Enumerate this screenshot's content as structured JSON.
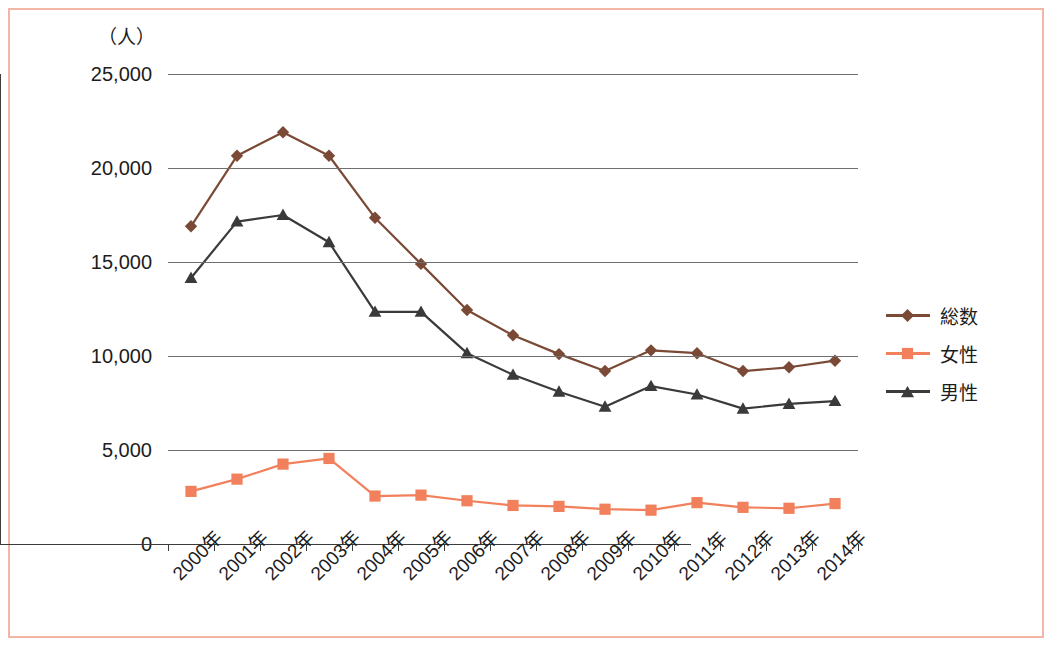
{
  "figure": {
    "unit_label": "（人）",
    "border_color": "#f3b6a6",
    "caption": ""
  },
  "legend": {
    "position": "right",
    "items": [
      {
        "label": "総数",
        "color": "#7a4a36",
        "marker": "diamond",
        "marker_icon": "diamond-marker-icon"
      },
      {
        "label": "女性",
        "color": "#f2805c",
        "marker": "square",
        "marker_icon": "square-marker-icon"
      },
      {
        "label": "男性",
        "color": "#3a3a3a",
        "marker": "triangle",
        "marker_icon": "triangle-marker-icon"
      }
    ]
  },
  "axes": {
    "y_ticks": [
      "25,000",
      "20,000",
      "15,000",
      "10,000",
      "5,000",
      "0"
    ],
    "y_tick_values": [
      25000,
      20000,
      15000,
      10000,
      5000,
      0
    ],
    "x_ticks": [
      "2000年",
      "2001年",
      "2002年",
      "2003年",
      "2004年",
      "2005年",
      "2006年",
      "2007年",
      "2008年",
      "2009年",
      "2010年",
      "2011年",
      "2012年",
      "2013年",
      "2014年"
    ]
  },
  "chart_data": {
    "type": "line",
    "title": "",
    "subtitle": "",
    "xlabel": "",
    "ylabel": "（人）",
    "ylim": [
      0,
      25000
    ],
    "ytick_step": 5000,
    "grid": true,
    "legend_position": "right",
    "categories": [
      "2000年",
      "2001年",
      "2002年",
      "2003年",
      "2004年",
      "2005年",
      "2006年",
      "2007年",
      "2008年",
      "2009年",
      "2010年",
      "2011年",
      "2012年",
      "2013年",
      "2014年"
    ],
    "series": [
      {
        "name": "総数",
        "color": "#7a4a36",
        "marker": "diamond",
        "values": [
          16900,
          20650,
          21900,
          20650,
          17350,
          14900,
          12450,
          11100,
          10100,
          9200,
          10300,
          10150,
          9200,
          9400,
          9750
        ]
      },
      {
        "name": "女性",
        "color": "#f2805c",
        "marker": "square",
        "values": [
          2800,
          3450,
          4250,
          4550,
          2550,
          2600,
          2300,
          2050,
          2000,
          1850,
          1800,
          2200,
          1950,
          1900,
          2150
        ]
      },
      {
        "name": "男性",
        "color": "#3a3a3a",
        "marker": "triangle",
        "values": [
          14150,
          17150,
          17500,
          16050,
          12350,
          12350,
          10150,
          9000,
          8100,
          7300,
          8400,
          7950,
          7200,
          7450,
          7600
        ]
      }
    ]
  }
}
